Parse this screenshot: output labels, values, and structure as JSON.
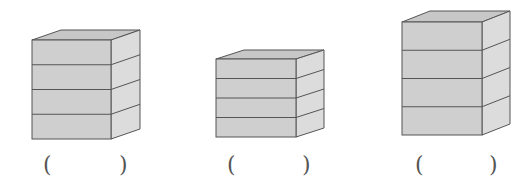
{
  "colors": {
    "front": "#cfcfcf",
    "side": "#dcdcdc",
    "top": "#c7c7c7",
    "stroke": "#555555"
  },
  "stacks": [
    {
      "name": "stack-1",
      "layers": 4,
      "front": {
        "x1": 32,
        "y1": 40,
        "x2": 111,
        "y2": 139
      },
      "depth": {
        "dx": 29,
        "dy": -10
      },
      "answer": {
        "open": "(",
        "close": ")",
        "value": ""
      }
    },
    {
      "name": "stack-2",
      "layers": 4,
      "front": {
        "x1": 216,
        "y1": 59,
        "x2": 296,
        "y2": 137
      },
      "depth": {
        "dx": 28,
        "dy": -9
      },
      "answer": {
        "open": "(",
        "close": ")",
        "value": ""
      }
    },
    {
      "name": "stack-3",
      "layers": 4,
      "front": {
        "x1": 402,
        "y1": 22,
        "x2": 482,
        "y2": 135
      },
      "depth": {
        "dx": 28,
        "dy": -11
      },
      "answer": {
        "open": "(",
        "close": ")",
        "value": ""
      }
    }
  ],
  "parens": [
    {
      "char": "(",
      "x": 43,
      "y": 154
    },
    {
      "char": ")",
      "x": 119,
      "y": 154
    },
    {
      "char": "(",
      "x": 227,
      "y": 154
    },
    {
      "char": ")",
      "x": 302,
      "y": 154
    },
    {
      "char": "(",
      "x": 415,
      "y": 154
    },
    {
      "char": ")",
      "x": 489,
      "y": 154
    }
  ]
}
